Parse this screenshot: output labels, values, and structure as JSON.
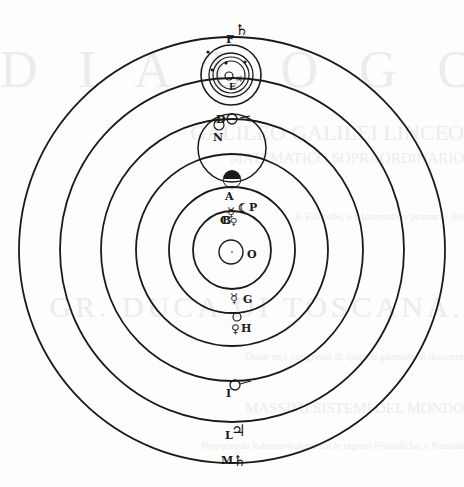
{
  "diagram": {
    "center": {
      "x": 232,
      "y": 250
    },
    "ink_color": "#1a1a1a",
    "paper_color": "#fdfdfc",
    "ghost_color": "#ececea",
    "orbits": [
      {
        "name": "saturn-orbit",
        "r": 213
      },
      {
        "name": "jupiter-orbit",
        "r": 172
      },
      {
        "name": "mars-orbit",
        "r": 131
      },
      {
        "name": "earth-orbit",
        "r": 96
      },
      {
        "name": "venus-orbit",
        "r": 63
      },
      {
        "name": "mercury-orbit",
        "r": 39
      },
      {
        "name": "sun",
        "r": 12
      }
    ],
    "labels": {
      "F": "F",
      "E": "E",
      "D": "D",
      "N": "N",
      "A": "A",
      "C": "C",
      "P": "P",
      "B": "B",
      "O": "O",
      "G": "G",
      "H": "H",
      "I": "I",
      "L": "L",
      "M": "M"
    },
    "symbols": {
      "saturn": "♄",
      "jupiter": "♃",
      "mars": "♂",
      "venus": "♀",
      "mercury": "☿",
      "moon": "☾"
    },
    "ghost_text": [
      "D I A L O G O",
      "DI",
      "GALILEO GALILEI LINCEO",
      "MATEMATICO SOPRAORDINARIO",
      "DELLO STUDIO DI PISA.",
      "E Filosofo, e Matematico primario del",
      "SERENISSIMO",
      "GR. DUCA DI TOSCANA.",
      "Doue ne i congressi di quattro giornate si discorre",
      "sopra i due",
      "MASSIMI SISTEMI DEL MONDO",
      "TOLEMAICO, E COPERNICANO;",
      "Proponendo indeterminatamente le ragioni Filosofiche, e Naturali",
      "tanto per l'vna, quanto per l'altra parte."
    ]
  }
}
